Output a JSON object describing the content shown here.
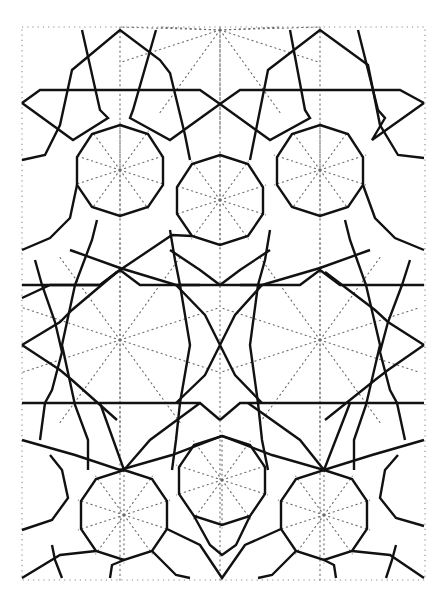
{
  "figure": {
    "title": "",
    "colors": {
      "line": "#111111",
      "construction": "#6a6a6a",
      "background": "#ffffff"
    }
  },
  "frame": {
    "x": 22,
    "y": 27,
    "width": 403,
    "height": 553
  },
  "decagons": [
    {
      "id": "top-left",
      "cx": 120,
      "cy": 170,
      "r": 46
    },
    {
      "id": "top-right",
      "cx": 320,
      "cy": 170,
      "r": 46
    },
    {
      "id": "upper-middle",
      "cx": 220,
      "cy": 200,
      "r": 46
    },
    {
      "id": "bottom-left",
      "cx": 124,
      "cy": 515,
      "r": 46
    },
    {
      "id": "bottom-middle",
      "cx": 222,
      "cy": 480,
      "r": 46
    },
    {
      "id": "bottom-right",
      "cx": 324,
      "cy": 515,
      "r": 46
    }
  ],
  "star_centers": [
    {
      "id": "top-mid",
      "cx": 220,
      "cy": 30
    },
    {
      "id": "mid-left",
      "cx": 120,
      "cy": 340
    },
    {
      "id": "mid-right",
      "cx": 320,
      "cy": 340
    }
  ],
  "horizontal_bands_y": [
    90,
    285,
    403
  ]
}
